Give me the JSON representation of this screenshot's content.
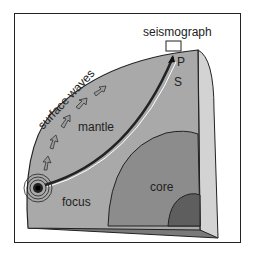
{
  "diagram": {
    "labels": {
      "seismograph": "seismograph",
      "p_wave": "P",
      "s_wave": "S",
      "surface_waves": "surface waves",
      "mantle": "mantle",
      "core": "core",
      "focus": "focus"
    },
    "colors": {
      "border": "#222222",
      "mantle_face": "#a9a9a9",
      "mantle_top": "#b5b5b5",
      "side_face": "#d3d3d3",
      "outer_core": "#8c8c8c",
      "inner_core": "#5e5e5e",
      "bottom_face": "#7a7a7a"
    }
  }
}
